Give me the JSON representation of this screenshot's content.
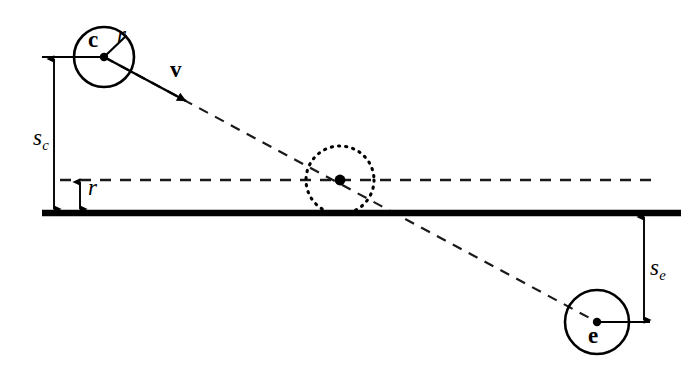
{
  "figure": {
    "type": "geometry-diagram",
    "background_color": "#ffffff",
    "stroke_color": "#000000",
    "width": 696,
    "height": 368
  },
  "labels": {
    "circle_c": "c",
    "radius_c": "r",
    "velocity": "v",
    "height_sc": "s",
    "height_sc_sub": "c",
    "radius_height": "r",
    "height_se": "s",
    "height_se_sub": "e",
    "circle_e": "e"
  },
  "elements": {
    "ground_line": {
      "name": "ground-line",
      "y": 213,
      "x_start": 42,
      "x_end": 681,
      "thickness": 6,
      "style": "solid"
    },
    "center_height_line": {
      "name": "center-height-dashed-line",
      "y": 180,
      "x_start": 60,
      "x_end": 652,
      "style": "dashed"
    },
    "circle_c": {
      "name": "circle-c",
      "cx": 104,
      "cy": 57,
      "r": 30,
      "style": "solid",
      "center_dot": true
    },
    "circle_mid": {
      "name": "circle-contact",
      "cx": 340,
      "cy": 180,
      "r": 34,
      "style": "dotted",
      "center_dot": true
    },
    "circle_e": {
      "name": "circle-e",
      "cx": 597,
      "cy": 322,
      "r": 32,
      "style": "solid",
      "center_dot": true
    },
    "trajectory": {
      "name": "trajectory-line",
      "from_x": 104,
      "from_y": 57,
      "to_x": 597,
      "to_y": 322,
      "style": "dashed",
      "solid_head_x": 187,
      "solid_head_y": 101,
      "arrow": true
    },
    "radius_spoke_c": {
      "name": "radius-spoke-c",
      "from_x": 104,
      "from_y": 57,
      "to_x": 126,
      "to_y": 36
    },
    "tick_c_level": {
      "name": "tick-line-c-level",
      "y": 57,
      "x_start": 42,
      "x_end": 104
    },
    "tick_e_level": {
      "name": "tick-line-e-level",
      "y": 322,
      "x_start": 597,
      "x_end": 648
    },
    "arrow_sc": {
      "name": "dimension-arrow-sc",
      "x": 54,
      "y_top": 57,
      "y_bottom": 211,
      "double_headed": true
    },
    "arrow_r": {
      "name": "dimension-arrow-r",
      "x": 80,
      "y_top": 180,
      "y_bottom": 211,
      "double_headed": true
    },
    "arrow_se": {
      "name": "dimension-arrow-se",
      "x": 644,
      "y_top": 215,
      "y_bottom": 322,
      "double_headed": true
    }
  }
}
